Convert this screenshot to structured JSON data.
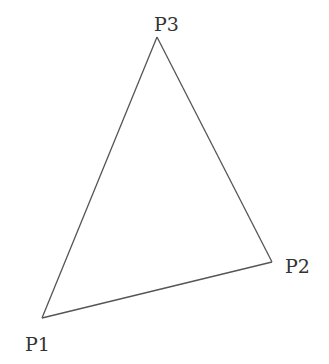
{
  "diagram": {
    "type": "triangle",
    "stroke_color": "#555555",
    "label_color": "#333333",
    "vertices": [
      {
        "id": "P1",
        "label": "P1",
        "x": 42,
        "y": 318
      },
      {
        "id": "P2",
        "label": "P2",
        "x": 272,
        "y": 262
      },
      {
        "id": "P3",
        "label": "P3",
        "x": 157,
        "y": 37
      }
    ],
    "edges": [
      {
        "from": "P1",
        "to": "P2"
      },
      {
        "from": "P2",
        "to": "P3"
      },
      {
        "from": "P3",
        "to": "P1"
      }
    ]
  }
}
